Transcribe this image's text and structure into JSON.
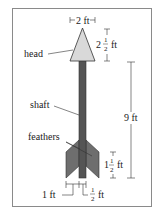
{
  "diagram": {
    "labels": {
      "head": "head",
      "shaft": "shaft",
      "feathers": "feathers"
    },
    "dimensions": {
      "head_width": {
        "whole": "2",
        "unit": "ft"
      },
      "head_height": {
        "whole": "2",
        "num": "1",
        "den": "2",
        "unit": "ft"
      },
      "shaft_length": {
        "whole": "9",
        "unit": "ft"
      },
      "feather_height": {
        "whole": "1",
        "num": "1",
        "den": "2",
        "unit": "ft"
      },
      "feather_width": {
        "whole": "1",
        "unit": "ft"
      },
      "shaft_width": {
        "num": "1",
        "den": "2",
        "unit": "ft"
      }
    },
    "colors": {
      "head_fill": "#d9d9d9",
      "shaft_fill": "#555555",
      "feather_fill": "#6e6e6e",
      "line": "#333333",
      "frame": "#8a8a8a"
    }
  }
}
